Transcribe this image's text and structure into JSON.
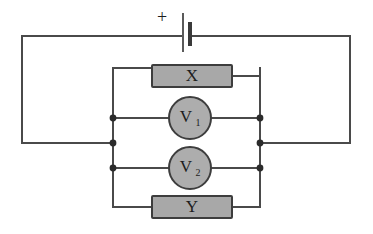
{
  "diagram": {
    "background_color": "#ffffff",
    "wire_color": "#4a4a4a",
    "component_fill_color": "#a8a8a8",
    "component_border_color": "#3d3d3d",
    "junction_color": "#2b2b2b",
    "canvas": {
      "width": 373,
      "height": 234
    }
  },
  "source": {
    "type": "battery-cell",
    "polarity_label": "+",
    "polarity_x": 162,
    "polarity_y": 18,
    "long_plate_x": 183,
    "short_plate_x": 190,
    "wire_y": 36
  },
  "outer_loop": {
    "left_x": 22,
    "right_x": 350,
    "top_y": 36,
    "bottom_y": 143
  },
  "inner_branch": {
    "left_x": 113,
    "right_x": 260,
    "top_branch_y": 76,
    "upper_meter_y": 118,
    "mid_y": 143,
    "lower_meter_y": 168,
    "bottom_branch_y": 207
  },
  "components": [
    {
      "name": "resistor-x",
      "label": "X",
      "kind": "box",
      "x": 152,
      "y": 65,
      "width": 80,
      "height": 22
    },
    {
      "name": "voltmeter-v1",
      "label": "V",
      "subscript": "1",
      "kind": "circle",
      "cx": 190,
      "cy": 118,
      "r": 21
    },
    {
      "name": "voltmeter-v2",
      "label": "V",
      "subscript": "2",
      "kind": "circle",
      "cx": 190,
      "cy": 168,
      "r": 21
    },
    {
      "name": "resistor-y",
      "label": "Y",
      "kind": "box",
      "x": 152,
      "y": 196,
      "width": 80,
      "height": 22
    }
  ],
  "junctions": [
    {
      "name": "junction-left-upper",
      "x": 113,
      "y": 118
    },
    {
      "name": "junction-left-mid",
      "x": 113,
      "y": 143
    },
    {
      "name": "junction-left-lower",
      "x": 113,
      "y": 168
    },
    {
      "name": "junction-right-upper",
      "x": 260,
      "y": 118
    },
    {
      "name": "junction-right-mid",
      "x": 260,
      "y": 143
    },
    {
      "name": "junction-right-lower",
      "x": 260,
      "y": 168
    }
  ],
  "labels": {
    "resistor_x": "X",
    "resistor_y": "Y",
    "voltmeter_1_letter": "V",
    "voltmeter_1_index": "1",
    "voltmeter_2_letter": "V",
    "voltmeter_2_index": "2",
    "positive_terminal": "+"
  }
}
